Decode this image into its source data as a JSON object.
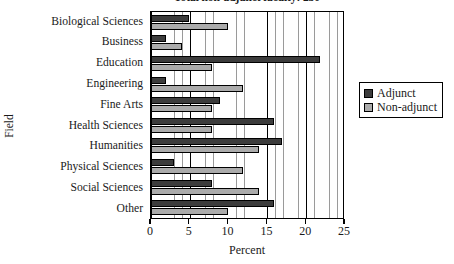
{
  "chart_data": {
    "type": "bar",
    "orientation": "horizontal",
    "title": "Total non-adjunct faculty: 230",
    "xlabel": "Percent",
    "ylabel": "Field",
    "xlim": [
      0,
      25
    ],
    "xticks": [
      0,
      5,
      10,
      15,
      20,
      25
    ],
    "grid": true,
    "grid_minor_step": 1,
    "grid_major_step": 5,
    "legend_position": "right",
    "categories": [
      "Biological Sciences",
      "Business",
      "Education",
      "Engineering",
      "Fine Arts",
      "Health Sciences",
      "Humanities",
      "Physical Sciences",
      "Social Sciences",
      "Other"
    ],
    "series": [
      {
        "name": "Adjunct",
        "color": "#3c3c3c",
        "values": [
          5,
          2,
          22,
          2,
          9,
          16,
          17,
          3,
          8,
          16
        ]
      },
      {
        "name": "Non-adjunct",
        "color": "#ababab",
        "values": [
          10,
          4,
          8,
          12,
          8,
          8,
          14,
          12,
          14,
          10
        ]
      }
    ]
  },
  "legend": {
    "items": [
      {
        "label": "Adjunct",
        "color": "#3c3c3c"
      },
      {
        "label": "Non-adjunct",
        "color": "#ababab"
      }
    ]
  }
}
